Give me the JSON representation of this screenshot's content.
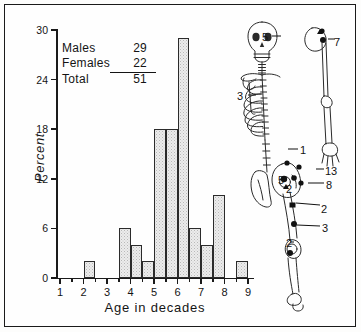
{
  "figure": {
    "background": "#fefefe",
    "frame_color": "#1a1a1a"
  },
  "legend": {
    "rows": [
      {
        "label": "Males",
        "value": "29",
        "underline": false
      },
      {
        "label": "Females",
        "value": "22",
        "underline": true
      },
      {
        "label": "Total",
        "value": "51",
        "underline": false
      }
    ]
  },
  "skeleton": {
    "title": "skeletal-fracture-site-diagram",
    "annotations": [
      {
        "id": "a1",
        "text": "5",
        "x": 26,
        "y": 20
      },
      {
        "id": "a2",
        "text": "7",
        "x": 98,
        "y": 25
      },
      {
        "id": "a3",
        "text": "3",
        "x": 1,
        "y": 79
      },
      {
        "id": "a4",
        "text": "1",
        "x": 64,
        "y": 133
      },
      {
        "id": "a5",
        "text": "13",
        "x": 89,
        "y": 154
      },
      {
        "id": "a6",
        "text": "5",
        "x": 42,
        "y": 163
      },
      {
        "id": "a7",
        "text": "2",
        "x": 50,
        "y": 172
      },
      {
        "id": "a8",
        "text": "8",
        "x": 90,
        "y": 168
      },
      {
        "id": "a9",
        "text": "2",
        "x": 85,
        "y": 192
      },
      {
        "id": "a10",
        "text": "3",
        "x": 86,
        "y": 211
      },
      {
        "id": "a11",
        "text": "2",
        "x": 50,
        "y": 226
      }
    ]
  },
  "chart_data": {
    "type": "bar",
    "title": "",
    "xlabel": "Age in decades",
    "ylabel": "Percent",
    "xlim": [
      0.5,
      9.5
    ],
    "ylim": [
      0,
      30
    ],
    "ytick_labels": [
      "0",
      "6",
      "12",
      "18",
      "24",
      "30"
    ],
    "ytick_values": [
      0,
      6,
      12,
      18,
      24,
      30
    ],
    "xtick_labels": [
      "1",
      "2",
      "3",
      "4",
      "5",
      "6",
      "7",
      "8",
      "9"
    ],
    "xtick_values": [
      1,
      2,
      3,
      4,
      5,
      6,
      7,
      8,
      9
    ],
    "grid": false,
    "legend_position": "upper-left-inside",
    "bin_width_decades": 0.5,
    "bars": [
      {
        "x_start": 2.0,
        "x_end": 2.5,
        "value": 2
      },
      {
        "x_start": 3.5,
        "x_end": 4.0,
        "value": 6
      },
      {
        "x_start": 4.0,
        "x_end": 4.5,
        "value": 4
      },
      {
        "x_start": 4.5,
        "x_end": 5.0,
        "value": 2
      },
      {
        "x_start": 5.0,
        "x_end": 5.5,
        "value": 18
      },
      {
        "x_start": 5.5,
        "x_end": 6.0,
        "value": 18
      },
      {
        "x_start": 6.0,
        "x_end": 6.5,
        "value": 29
      },
      {
        "x_start": 6.5,
        "x_end": 7.0,
        "value": 6
      },
      {
        "x_start": 7.0,
        "x_end": 7.5,
        "value": 4
      },
      {
        "x_start": 7.5,
        "x_end": 8.0,
        "value": 10
      },
      {
        "x_start": 8.5,
        "x_end": 9.0,
        "value": 2
      }
    ],
    "categories": [
      "2.0-2.5",
      "3.5-4.0",
      "4.0-4.5",
      "4.5-5.0",
      "5.0-5.5",
      "5.5-6.0",
      "6.0-6.5",
      "6.5-7.0",
      "7.0-7.5",
      "7.5-8.0",
      "8.5-9.0"
    ],
    "values": [
      2,
      6,
      4,
      2,
      18,
      18,
      29,
      6,
      4,
      10,
      2
    ]
  }
}
